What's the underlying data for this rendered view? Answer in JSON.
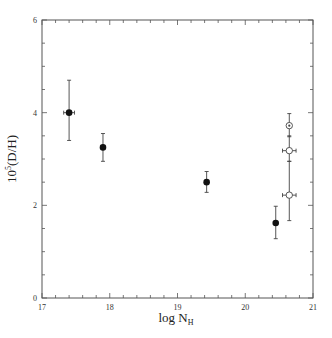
{
  "chart_data": {
    "type": "scatter",
    "title": "",
    "xlabel": "log N_H",
    "ylabel": "10^5(D/H)",
    "xlim": [
      17,
      21
    ],
    "ylim": [
      0,
      6
    ],
    "x_ticks": [
      17,
      18,
      19,
      20,
      21
    ],
    "y_ticks": [
      0,
      2,
      4,
      6
    ],
    "x_tick_labels": [
      "17",
      "18",
      "19",
      "20",
      "21"
    ],
    "y_tick_labels": [
      "0",
      "2",
      "4",
      "6"
    ],
    "grid": false,
    "legend": null,
    "series": [
      {
        "name": "filled",
        "marker": "filled-circle",
        "points": [
          {
            "x": 17.4,
            "y": 4.0,
            "y_lo": 3.4,
            "y_hi": 4.7,
            "x_err": 0.08
          },
          {
            "x": 17.9,
            "y": 3.25,
            "y_lo": 2.95,
            "y_hi": 3.55,
            "x_err": 0
          },
          {
            "x": 19.43,
            "y": 2.5,
            "y_lo": 2.28,
            "y_hi": 2.73,
            "x_err": 0
          },
          {
            "x": 20.45,
            "y": 1.62,
            "y_lo": 1.28,
            "y_hi": 1.98,
            "x_err": 0
          }
        ]
      },
      {
        "name": "open",
        "marker": "open-circle",
        "points": [
          {
            "x": 20.65,
            "y": 3.72,
            "y_lo": 3.48,
            "y_hi": 3.98,
            "x_err": 0,
            "marker": "circled-dot"
          },
          {
            "x": 20.65,
            "y": 3.18,
            "y_lo": 2.95,
            "y_hi": 3.5,
            "x_err": 0.1
          },
          {
            "x": 20.65,
            "y": 2.22,
            "y_lo": 1.67,
            "y_hi": 2.95,
            "x_err": 0.1
          }
        ]
      }
    ]
  },
  "labels": {
    "xlabel_main": "log N",
    "xlabel_sub": "H",
    "ylabel_main": "10",
    "ylabel_sup": "5",
    "ylabel_rest": "(D/H)"
  }
}
